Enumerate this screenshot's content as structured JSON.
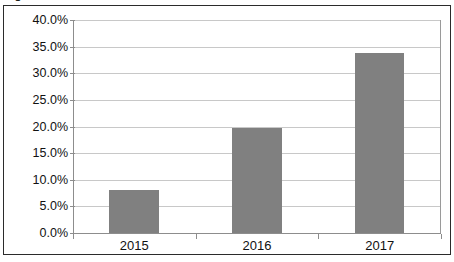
{
  "figure": {
    "caption": "Figure 2.7: 4G/LTE subscribers in Latin America"
  },
  "chart_data": {
    "type": "bar",
    "title": "",
    "xlabel": "",
    "ylabel": "",
    "categories": [
      "2015",
      "2016",
      "2017"
    ],
    "values": [
      8.1,
      19.8,
      33.8
    ],
    "value_labels": [
      "8.1%",
      "19.8%",
      "33.8%"
    ],
    "ylim": [
      0,
      40
    ],
    "ytick_values": [
      0,
      5,
      10,
      15,
      20,
      25,
      30,
      35,
      40
    ],
    "ytick_labels": [
      "0.0%",
      "5.0%",
      "10.0%",
      "15.0%",
      "20.0%",
      "25.0%",
      "30.0%",
      "35.0%",
      "40.0%"
    ],
    "grid": true,
    "legend": false,
    "legend_position": "none",
    "series": [
      {
        "name": "Share",
        "values": [
          8.1,
          19.8,
          33.8
        ],
        "color": "#808080"
      }
    ],
    "colors": {
      "bar_fill": "#808080",
      "gridline": "#c8c8c8",
      "axis": "#8d8d8d",
      "frame": "#2b2b2b",
      "plot_background": "#ffffff",
      "text": "#111111"
    }
  }
}
